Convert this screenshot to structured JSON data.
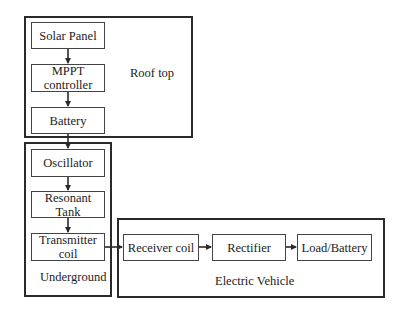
{
  "diagram": {
    "groups": [
      {
        "id": "rooftop",
        "label": "Roof top"
      },
      {
        "id": "underground",
        "label": "Underground"
      },
      {
        "id": "ev",
        "label": "Electric Vehicle"
      }
    ],
    "blocks": {
      "solar_panel": "Solar Panel",
      "mppt_line1": "MPPT",
      "mppt_line2": "controller",
      "battery": "Battery",
      "oscillator": "Oscillator",
      "resonant_line1": "Resonant",
      "resonant_line2": "Tank",
      "transmitter_line1": "Transmitter",
      "transmitter_line2": "coil",
      "receiver_coil": "Receiver coil",
      "rectifier": "Rectifier",
      "load_battery": "Load/Battery"
    },
    "connections": [
      [
        "Solar Panel",
        "MPPT controller"
      ],
      [
        "MPPT controller",
        "Battery"
      ],
      [
        "Battery",
        "Oscillator"
      ],
      [
        "Oscillator",
        "Resonant Tank"
      ],
      [
        "Resonant Tank",
        "Transmitter coil"
      ],
      [
        "Transmitter coil",
        "Receiver coil"
      ],
      [
        "Receiver coil",
        "Rectifier"
      ],
      [
        "Rectifier",
        "Load/Battery"
      ]
    ],
    "colors": {
      "line": "#2a2a2a",
      "background": "#ffffff"
    }
  }
}
